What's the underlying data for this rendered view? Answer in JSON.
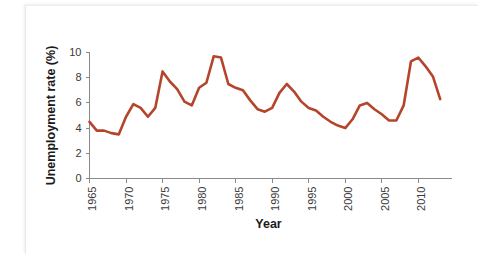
{
  "chart_data": {
    "type": "line",
    "title": "",
    "xlabel": "Year",
    "ylabel": "Unemployment rate (%)",
    "xlim": [
      1965,
      2014
    ],
    "ylim": [
      0,
      10
    ],
    "grid": false,
    "legend": "none",
    "line_color": "#b5452a",
    "axis_color": "#8a8a8a",
    "xticks": [
      1965,
      1970,
      1975,
      1980,
      1985,
      1990,
      1995,
      2000,
      2005,
      2010
    ],
    "xtick_labels": [
      "1965",
      "1970",
      "1975",
      "1980",
      "1985",
      "1990",
      "1995",
      "2000",
      "2005",
      "2010"
    ],
    "yticks": [
      0,
      2,
      4,
      6,
      8,
      10
    ],
    "ytick_labels": [
      "0",
      "2",
      "4",
      "6",
      "8",
      "10"
    ],
    "series": [
      {
        "name": "Unemployment rate",
        "x": [
          1965,
          1966,
          1967,
          1968,
          1969,
          1970,
          1971,
          1972,
          1973,
          1974,
          1975,
          1976,
          1977,
          1978,
          1979,
          1980,
          1981,
          1982,
          1983,
          1984,
          1985,
          1986,
          1987,
          1988,
          1989,
          1990,
          1991,
          1992,
          1993,
          1994,
          1995,
          1996,
          1997,
          1998,
          1999,
          2000,
          2001,
          2002,
          2003,
          2004,
          2005,
          2006,
          2007,
          2008,
          2009,
          2010,
          2011,
          2012,
          2013
        ],
        "values": [
          4.5,
          3.8,
          3.8,
          3.6,
          3.5,
          4.9,
          5.9,
          5.6,
          4.9,
          5.6,
          8.5,
          7.7,
          7.1,
          6.1,
          5.8,
          7.2,
          7.6,
          9.7,
          9.6,
          7.5,
          7.2,
          7.0,
          6.2,
          5.5,
          5.3,
          5.6,
          6.8,
          7.5,
          6.9,
          6.1,
          5.6,
          5.4,
          4.9,
          4.5,
          4.2,
          4.0,
          4.7,
          5.8,
          6.0,
          5.5,
          5.1,
          4.6,
          4.6,
          5.8,
          9.3,
          9.6,
          8.9,
          8.1,
          6.3
        ]
      }
    ]
  },
  "figure": {
    "x_axis_title": "Year",
    "y_axis_title": "Unemployment rate (%)"
  }
}
